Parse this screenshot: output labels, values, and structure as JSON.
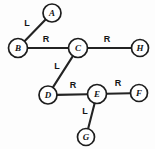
{
  "diagram": {
    "type": "node-link-tree",
    "canvas": {
      "width": 155,
      "height": 149,
      "background": "#fdfdfd"
    },
    "style": {
      "node_fill": "#ffffff",
      "node_stroke": "#1d1d1d",
      "edge_stroke": "#232323",
      "label_color": "#141414"
    },
    "nodes": [
      {
        "id": "A",
        "label": "A",
        "x": 52,
        "y": 13,
        "r": 9
      },
      {
        "id": "B",
        "label": "B",
        "x": 18,
        "y": 48,
        "r": 9.5
      },
      {
        "id": "C",
        "label": "C",
        "x": 78,
        "y": 48,
        "r": 9.5
      },
      {
        "id": "H",
        "label": "H",
        "x": 140,
        "y": 48,
        "r": 8.5
      },
      {
        "id": "D",
        "label": "D",
        "x": 48,
        "y": 95,
        "r": 9
      },
      {
        "id": "E",
        "label": "E",
        "x": 97,
        "y": 94,
        "r": 9.5
      },
      {
        "id": "F",
        "label": "F",
        "x": 139,
        "y": 93,
        "r": 8.5
      },
      {
        "id": "G",
        "label": "G",
        "x": 86,
        "y": 137,
        "r": 8.5
      }
    ],
    "edges": [
      {
        "id": "B-A",
        "from": "B",
        "to": "A",
        "label": "L",
        "lx": 27,
        "ly": 23
      },
      {
        "id": "B-C",
        "from": "B",
        "to": "C",
        "label": "R",
        "lx": 46,
        "ly": 39
      },
      {
        "id": "C-H",
        "from": "C",
        "to": "H",
        "label": "R",
        "lx": 107,
        "ly": 39
      },
      {
        "id": "C-D",
        "from": "C",
        "to": "D",
        "label": "L",
        "lx": 57,
        "ly": 66
      },
      {
        "id": "D-E",
        "from": "D",
        "to": "E",
        "label": "R",
        "lx": 73,
        "ly": 85
      },
      {
        "id": "E-F",
        "from": "E",
        "to": "F",
        "label": "R",
        "lx": 118,
        "ly": 83
      },
      {
        "id": "E-G",
        "from": "E",
        "to": "G",
        "label": "L",
        "lx": 85,
        "ly": 111
      }
    ]
  }
}
